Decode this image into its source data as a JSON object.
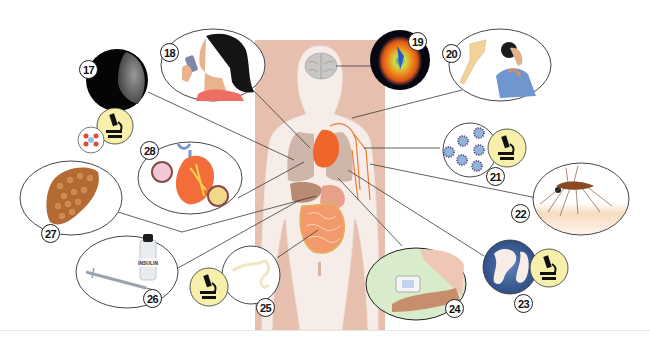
{
  "figure": {
    "colors": {
      "panel": "#e7bfae",
      "body": "#f6ece6",
      "heart": "#f0652a",
      "lungs": "#cdb4a8",
      "intestines": "#f39a6d",
      "microscope_badge": "#f7efaa",
      "leader_line": "#3a3a3a",
      "badge_border": "#222222"
    }
  },
  "callouts": [
    {
      "number": "17",
      "subject": "lung x-ray / tuberculosis",
      "icons": [
        "xray-image",
        "microscope",
        "bacteria"
      ]
    },
    {
      "number": "18",
      "subject": "asthma inhaler",
      "icons": [
        "person-with-inhaler"
      ]
    },
    {
      "number": "19",
      "subject": "brain scan",
      "icons": [
        "brain-scan"
      ]
    },
    {
      "number": "20",
      "subject": "shoulder / neck pain",
      "icons": [
        "bone-joint",
        "person-touching-neck"
      ]
    },
    {
      "number": "21",
      "subject": "virus particles",
      "icons": [
        "virus",
        "microscope"
      ]
    },
    {
      "number": "22",
      "subject": "mosquito / malaria",
      "icons": [
        "mosquito"
      ]
    },
    {
      "number": "23",
      "subject": "parasitic worms / bacteria",
      "icons": [
        "worms",
        "microscope"
      ]
    },
    {
      "number": "24",
      "subject": "blood pressure monitor",
      "icons": [
        "blood-pressure-monitor"
      ]
    },
    {
      "number": "25",
      "subject": "intestinal worm",
      "icons": [
        "worm",
        "microscope"
      ]
    },
    {
      "number": "26",
      "subject": "insulin injection / diabetes",
      "icons": [
        "syringe",
        "insulin-bottle"
      ],
      "bottle_label": "INSULIN"
    },
    {
      "number": "27",
      "subject": "liver / cirrhosis",
      "icons": [
        "liver"
      ]
    },
    {
      "number": "28",
      "subject": "heart / coronary artery disease",
      "icons": [
        "heart",
        "artery-cross-section"
      ]
    }
  ]
}
